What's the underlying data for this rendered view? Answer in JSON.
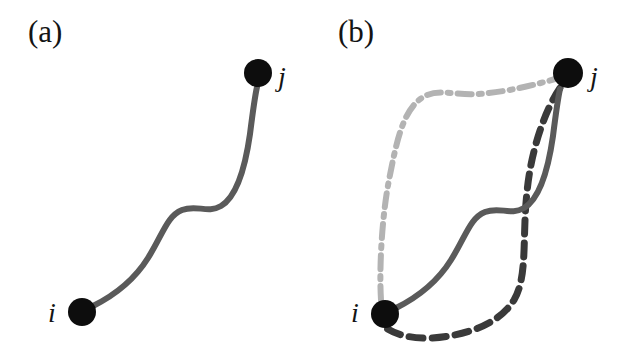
{
  "figure": {
    "width": 627,
    "height": 358,
    "background_color": "#ffffff",
    "panels": [
      {
        "id": "a",
        "label": "(a)",
        "label_position": {
          "x": 28,
          "y": 42
        },
        "nodes": [
          {
            "id": "i",
            "label": "i",
            "center": {
              "x": 82,
              "y": 312
            },
            "radius": 14,
            "color": "#0d0d0d",
            "label_position": {
              "x": 48,
              "y": 322
            }
          },
          {
            "id": "j",
            "label": "j",
            "center": {
              "x": 258,
              "y": 73
            },
            "radius": 14,
            "color": "#0d0d0d",
            "label_position": {
              "x": 278,
              "y": 86
            }
          }
        ],
        "edges": [
          {
            "id": "solid-path-a",
            "style": "solid",
            "color": "#5a5a5a",
            "width": 6,
            "dasharray": "",
            "from": "i",
            "to": "j",
            "path": "M 93 306 C 113 296 133 282 148 258 C 163 234 167 216 182 210 C 197 204 207 214 221 206 C 238 196 246 162 250 134 C 253 110 255 96 257 87"
          }
        ]
      },
      {
        "id": "b",
        "label": "(b)",
        "label_position": {
          "x": 338,
          "y": 42
        },
        "nodes": [
          {
            "id": "i",
            "label": "i",
            "center": {
              "x": 385,
              "y": 314
            },
            "radius": 14,
            "color": "#0d0d0d",
            "label_position": {
              "x": 351,
              "y": 322
            }
          },
          {
            "id": "j",
            "label": "j",
            "center": {
              "x": 568,
              "y": 73
            },
            "radius": 15,
            "color": "#0d0d0d",
            "label_position": {
              "x": 590,
              "y": 86
            }
          }
        ],
        "edges": [
          {
            "id": "dashdot-path-b",
            "style": "dash-dot",
            "color": "#b3b3b3",
            "width": 6,
            "dasharray": "14 7 3 7",
            "from": "i",
            "to": "j",
            "path": "M 381 300 C 379 268 382 216 389 180 C 396 144 402 114 419 100 C 436 86 452 96 478 94 C 508 92 538 84 555 79"
          },
          {
            "id": "dashed-path-b",
            "style": "dashed",
            "color": "#3a3a3a",
            "width": 7,
            "dasharray": "14 9",
            "from": "j",
            "to": "i",
            "path": "M 560 88 C 545 110 531 150 527 192 C 522 238 528 276 514 300 C 498 326 462 336 432 338 C 410 339 395 334 386 328"
          },
          {
            "id": "solid-path-b",
            "style": "solid",
            "color": "#5a5a5a",
            "width": 6,
            "dasharray": "",
            "from": "i",
            "to": "j",
            "path": "M 396 308 C 416 298 436 284 451 260 C 466 236 470 218 485 212 C 500 206 510 216 524 208 C 541 198 549 164 553 136 C 556 112 558 98 560 89"
          }
        ]
      }
    ]
  }
}
